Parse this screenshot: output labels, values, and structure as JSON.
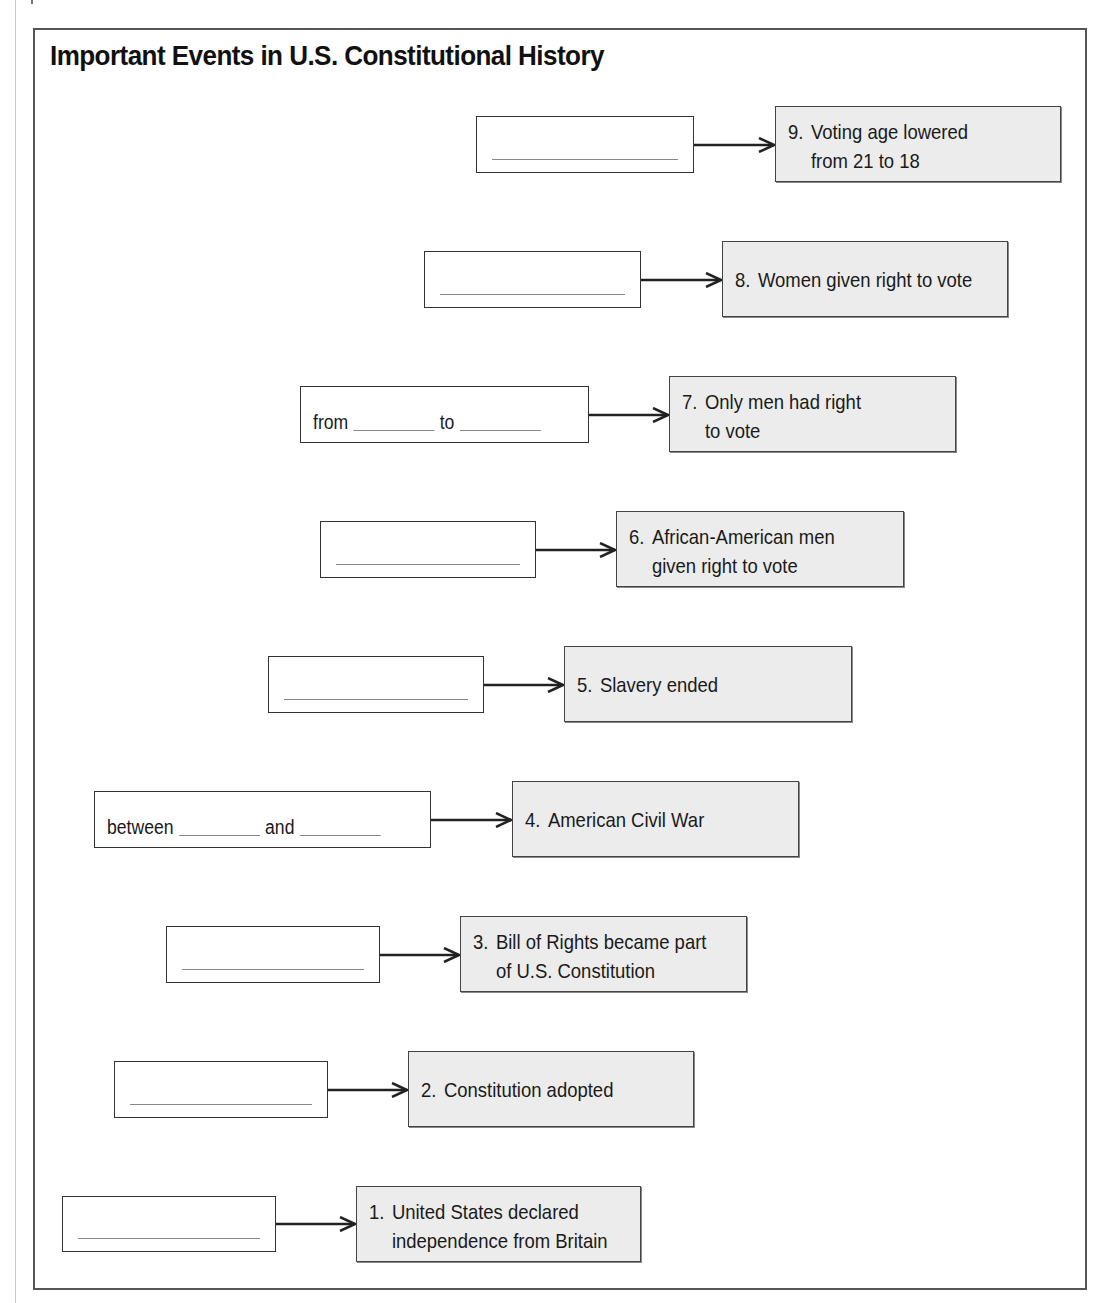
{
  "title": "Important Events in U.S. Constitutional History",
  "rows": [
    {
      "number": "9.",
      "line1": "Voting age lowered",
      "line2": "from 21 to 18",
      "blank": {
        "x": 476,
        "y": 116,
        "w": 218,
        "h": 57,
        "type": "line"
      },
      "event": {
        "x": 775,
        "y": 106,
        "w": 286,
        "h": 76
      }
    },
    {
      "number": "8.",
      "line1": "Women given right to vote",
      "line2": "",
      "blank": {
        "x": 424,
        "y": 251,
        "w": 217,
        "h": 57,
        "type": "line"
      },
      "event": {
        "x": 722,
        "y": 241,
        "w": 286,
        "h": 76
      }
    },
    {
      "number": "7.",
      "line1": "Only men had right",
      "line2": "to vote",
      "blank": {
        "x": 300,
        "y": 386,
        "w": 289,
        "h": 57,
        "type": "range",
        "prefix": "from",
        "middle": "to"
      },
      "event": {
        "x": 669,
        "y": 376,
        "w": 287,
        "h": 76
      }
    },
    {
      "number": "6.",
      "line1": "African-American men",
      "line2": "given right to vote",
      "blank": {
        "x": 320,
        "y": 521,
        "w": 216,
        "h": 57,
        "type": "line"
      },
      "event": {
        "x": 616,
        "y": 511,
        "w": 288,
        "h": 76
      }
    },
    {
      "number": "5.",
      "line1": "Slavery ended",
      "line2": "",
      "blank": {
        "x": 268,
        "y": 656,
        "w": 216,
        "h": 57,
        "type": "line"
      },
      "event": {
        "x": 564,
        "y": 646,
        "w": 288,
        "h": 76
      }
    },
    {
      "number": "4.",
      "line1": "American Civil War",
      "line2": "",
      "blank": {
        "x": 94,
        "y": 791,
        "w": 337,
        "h": 57,
        "type": "range",
        "prefix": "between",
        "middle": "and"
      },
      "event": {
        "x": 512,
        "y": 781,
        "w": 287,
        "h": 76
      }
    },
    {
      "number": "3.",
      "line1": "Bill of Rights became part",
      "line2": "of U.S. Constitution",
      "blank": {
        "x": 166,
        "y": 926,
        "w": 214,
        "h": 57,
        "type": "line"
      },
      "event": {
        "x": 460,
        "y": 916,
        "w": 287,
        "h": 76
      }
    },
    {
      "number": "2.",
      "line1": "Constitution adopted",
      "line2": "",
      "blank": {
        "x": 114,
        "y": 1061,
        "w": 214,
        "h": 57,
        "type": "line"
      },
      "event": {
        "x": 408,
        "y": 1051,
        "w": 286,
        "h": 76
      }
    },
    {
      "number": "1.",
      "line1": "United States declared",
      "line2": "independence from Britain",
      "blank": {
        "x": 62,
        "y": 1196,
        "w": 214,
        "h": 56,
        "type": "line"
      },
      "event": {
        "x": 356,
        "y": 1186,
        "w": 285,
        "h": 76
      }
    }
  ],
  "colors": {
    "event_fill": "#ececec",
    "border": "#444444",
    "frame": "#555555"
  }
}
